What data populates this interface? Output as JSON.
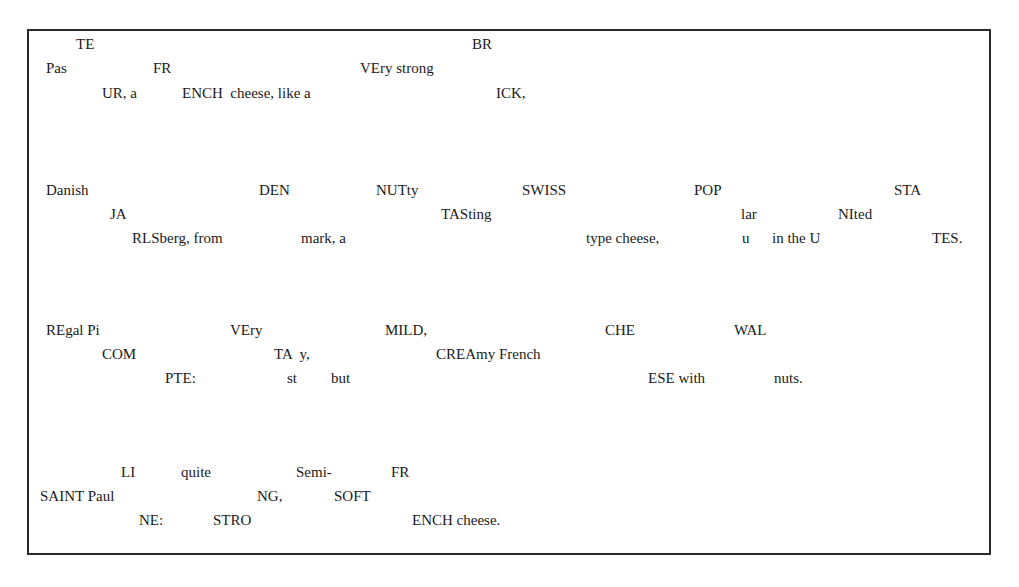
{
  "document": {
    "description": "Scrambled cheese descriptions with fragments split across three vertical offsets",
    "entries": [
      {
        "id": "pasteur",
        "fragments": [
          {
            "text": "TE",
            "x": 76,
            "y": 48
          },
          {
            "text": "Pas",
            "x": 46,
            "y": 72
          },
          {
            "text": "FR",
            "x": 153,
            "y": 72
          },
          {
            "text": "UR, a",
            "x": 102,
            "y": 97
          },
          {
            "text": "ENCH  cheese, like a",
            "x": 182,
            "y": 97
          },
          {
            "text": "VEry strong",
            "x": 360,
            "y": 72
          },
          {
            "text": "BR",
            "x": 472,
            "y": 48
          },
          {
            "text": "ICK,",
            "x": 496,
            "y": 97
          }
        ]
      },
      {
        "id": "jarlsberg",
        "fragments": [
          {
            "text": "Danish",
            "x": 46,
            "y": 194
          },
          {
            "text": "JA",
            "x": 110,
            "y": 218
          },
          {
            "text": "RLSberg, from",
            "x": 132,
            "y": 242
          },
          {
            "text": "DEN",
            "x": 259,
            "y": 194
          },
          {
            "text": "mark, a",
            "x": 301,
            "y": 242
          },
          {
            "text": "NUTty",
            "x": 376,
            "y": 194
          },
          {
            "text": "TASting",
            "x": 441,
            "y": 218
          },
          {
            "text": "SWISS",
            "x": 522,
            "y": 194
          },
          {
            "text": "type cheese,",
            "x": 586,
            "y": 242
          },
          {
            "text": "POP",
            "x": 694,
            "y": 194
          },
          {
            "text": "lar",
            "x": 741,
            "y": 218
          },
          {
            "text": "u",
            "x": 742,
            "y": 242
          },
          {
            "text": "in the U",
            "x": 772,
            "y": 242
          },
          {
            "text": "NIted",
            "x": 838,
            "y": 218
          },
          {
            "text": "STA",
            "x": 894,
            "y": 194
          },
          {
            "text": "TES.",
            "x": 932,
            "y": 242
          }
        ]
      },
      {
        "id": "regal-picompte",
        "fragments": [
          {
            "text": "REgal Pi",
            "x": 46,
            "y": 334
          },
          {
            "text": "COM",
            "x": 102,
            "y": 358
          },
          {
            "text": "PTE:",
            "x": 165,
            "y": 382
          },
          {
            "text": "VEry",
            "x": 230,
            "y": 334
          },
          {
            "text": "TA  y,",
            "x": 274,
            "y": 358
          },
          {
            "text": "st",
            "x": 287,
            "y": 382
          },
          {
            "text": "but",
            "x": 331,
            "y": 382
          },
          {
            "text": "MILD,",
            "x": 385,
            "y": 334
          },
          {
            "text": "CREAmy French",
            "x": 436,
            "y": 358
          },
          {
            "text": "CHE",
            "x": 605,
            "y": 334
          },
          {
            "text": "ESE with",
            "x": 648,
            "y": 382
          },
          {
            "text": "WAL",
            "x": 734,
            "y": 334
          },
          {
            "text": "nuts.",
            "x": 774,
            "y": 382
          }
        ]
      },
      {
        "id": "saint-paulin",
        "fragments": [
          {
            "text": "LI",
            "x": 121,
            "y": 476
          },
          {
            "text": "SAINT Paul",
            "x": 40,
            "y": 500
          },
          {
            "text": "NE:",
            "x": 139,
            "y": 524
          },
          {
            "text": "quite",
            "x": 181,
            "y": 476
          },
          {
            "text": "STRO",
            "x": 213,
            "y": 524
          },
          {
            "text": "NG,",
            "x": 257,
            "y": 500
          },
          {
            "text": "Semi-",
            "x": 296,
            "y": 476
          },
          {
            "text": "SOFT",
            "x": 334,
            "y": 500
          },
          {
            "text": "FR",
            "x": 391,
            "y": 476
          },
          {
            "text": "ENCH cheese.",
            "x": 412,
            "y": 524
          }
        ]
      }
    ]
  },
  "colors": {
    "text": "#1a1a1a",
    "border": "#2a2a2a",
    "background": "#ffffff"
  }
}
